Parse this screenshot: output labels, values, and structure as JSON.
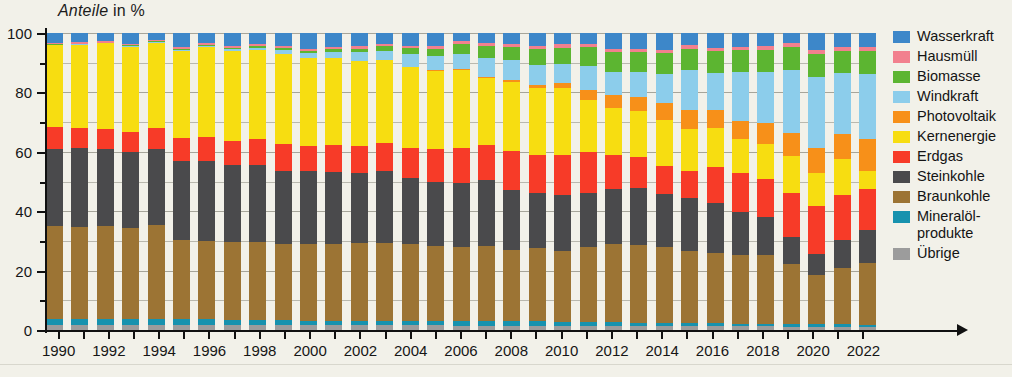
{
  "axis_title": {
    "emphasis": "Anteile",
    "rest": " in %"
  },
  "y_axis": {
    "labels": [
      "0",
      "20",
      "40",
      "60",
      "80",
      "100"
    ],
    "values": [
      0,
      20,
      40,
      60,
      80,
      100
    ],
    "minor_values": [
      10,
      30,
      50,
      70,
      90
    ],
    "min": 0,
    "max": 100
  },
  "x_axis": {
    "tick_labels": [
      "1990",
      "1992",
      "1994",
      "1996",
      "1998",
      "2000",
      "2002",
      "2004",
      "2006",
      "2008",
      "2010",
      "2012",
      "2014",
      "2016",
      "2018",
      "2020",
      "2022"
    ]
  },
  "legend": {
    "items": [
      {
        "label": "Wasserkraft",
        "color": "#3d87c9"
      },
      {
        "label": "Hausmüll",
        "color": "#f2808e"
      },
      {
        "label": "Biomasse",
        "color": "#5cb531"
      },
      {
        "label": "Windkraft",
        "color": "#8ccdeb"
      },
      {
        "label": "Photovoltaik",
        "color": "#f79019"
      },
      {
        "label": "Kernenergie",
        "color": "#f7dd11"
      },
      {
        "label": "Erdgas",
        "color": "#f73b28"
      },
      {
        "label": "Steinkohle",
        "color": "#4a4a4c"
      },
      {
        "label": "Braunkohle",
        "color": "#9c7434"
      },
      {
        "label": "Mineralöl-\nprodukte",
        "color": "#1792ae"
      },
      {
        "label": "Übrige",
        "color": "#9c9c9c"
      }
    ]
  },
  "chart_data": {
    "type": "bar",
    "stacked": true,
    "title": "Anteile in %",
    "xlabel": "",
    "ylabel": "Anteile in %",
    "ylim": [
      0,
      100
    ],
    "grid": true,
    "legend_position": "right",
    "categories": [
      1990,
      1991,
      1992,
      1993,
      1994,
      1995,
      1996,
      1997,
      1998,
      1999,
      2000,
      2001,
      2002,
      2003,
      2004,
      2005,
      2006,
      2007,
      2008,
      2009,
      2010,
      2011,
      2012,
      2013,
      2014,
      2015,
      2016,
      2017,
      2018,
      2019,
      2020,
      2021,
      2022
    ],
    "stack_order_bottom_to_top": [
      "Übrige",
      "Mineralölprodukte",
      "Braunkohle",
      "Steinkohle",
      "Erdgas",
      "Kernenergie",
      "Photovoltaik",
      "Windkraft",
      "Biomasse",
      "Hausmüll",
      "Wasserkraft"
    ],
    "series": [
      {
        "name": "Übrige",
        "color": "#9c9c9c",
        "values": [
          1.6,
          1.6,
          1.6,
          1.6,
          1.6,
          1.6,
          1.6,
          1.6,
          1.6,
          1.6,
          1.6,
          1.6,
          1.6,
          1.6,
          1.6,
          1.6,
          1.5,
          1.5,
          1.5,
          1.5,
          1.4,
          1.4,
          1.4,
          1.4,
          1.3,
          1.3,
          1.3,
          1.2,
          1.2,
          1.1,
          1.1,
          1.1,
          1.0
        ]
      },
      {
        "name": "Mineralölprodukte",
        "color": "#1792ae",
        "values": [
          2.2,
          2.2,
          2.1,
          2.0,
          2.0,
          1.9,
          1.9,
          1.8,
          1.8,
          1.7,
          1.6,
          1.6,
          1.5,
          1.5,
          1.5,
          1.5,
          1.5,
          1.5,
          1.5,
          1.5,
          1.4,
          1.3,
          1.2,
          1.1,
          1.0,
          1.0,
          1.0,
          0.9,
          0.9,
          0.9,
          0.8,
          0.8,
          0.8
        ]
      },
      {
        "name": "Braunkohle",
        "color": "#9c7434",
        "values": [
          31.1,
          30.9,
          31.4,
          31.2,
          31.8,
          26.4,
          26.0,
          26.1,
          25.6,
          25.5,
          25.6,
          25.8,
          26.2,
          26.4,
          26.0,
          25.2,
          25.1,
          25.3,
          24.3,
          25.0,
          23.9,
          25.2,
          26.2,
          26.2,
          25.5,
          24.3,
          23.8,
          23.3,
          23.0,
          20.1,
          16.5,
          19.1,
          20.6
        ]
      },
      {
        "name": "Steinkohle",
        "color": "#4a4a4c",
        "values": [
          26.2,
          26.5,
          25.8,
          25.6,
          25.6,
          26.2,
          26.3,
          25.9,
          25.6,
          24.9,
          24.8,
          24.2,
          23.6,
          24.0,
          22.6,
          21.6,
          21.5,
          22.1,
          20.3,
          18.6,
          18.7,
          18.4,
          18.7,
          19.1,
          18.0,
          17.9,
          16.8,
          14.3,
          12.8,
          9.2,
          7.2,
          9.3,
          11.2
        ]
      },
      {
        "name": "Erdgas",
        "color": "#f73b28",
        "values": [
          7.1,
          6.8,
          6.9,
          6.8,
          6.9,
          7.6,
          7.9,
          8.3,
          8.6,
          8.8,
          8.5,
          9.0,
          9.1,
          9.6,
          10.2,
          11.2,
          11.6,
          12.0,
          13.2,
          12.9,
          13.6,
          13.6,
          11.3,
          10.5,
          9.5,
          9.1,
          12.1,
          13.1,
          12.8,
          14.9,
          16.0,
          15.3,
          13.8
        ]
      },
      {
        "name": "Kernenergie",
        "color": "#f7dd11",
        "values": [
          27.7,
          28.1,
          28.7,
          29.2,
          28.9,
          29.0,
          29.6,
          30.3,
          29.2,
          30.5,
          29.5,
          29.5,
          28.6,
          27.8,
          27.5,
          26.5,
          26.3,
          22.3,
          23.4,
          22.8,
          22.4,
          17.7,
          16.0,
          15.4,
          15.5,
          14.2,
          13.1,
          11.6,
          11.8,
          12.4,
          11.3,
          11.9,
          6.3
        ]
      },
      {
        "name": "Photovoltaik",
        "color": "#f79019",
        "values": [
          0.0,
          0.0,
          0.0,
          0.0,
          0.0,
          0.0,
          0.0,
          0.0,
          0.0,
          0.0,
          0.0,
          0.0,
          0.1,
          0.1,
          0.2,
          0.2,
          0.4,
          0.5,
          0.7,
          1.1,
          1.9,
          3.2,
          4.2,
          4.9,
          5.8,
          6.3,
          5.9,
          6.1,
          7.1,
          7.6,
          8.5,
          8.4,
          10.6
        ]
      },
      {
        "name": "Windkraft",
        "color": "#8ccdeb",
        "values": [
          0.1,
          0.1,
          0.1,
          0.2,
          0.2,
          0.3,
          0.4,
          0.5,
          0.8,
          1.2,
          1.6,
          1.9,
          2.8,
          3.2,
          4.3,
          4.6,
          5.2,
          6.5,
          6.8,
          6.9,
          6.2,
          8.1,
          8.0,
          8.3,
          9.6,
          13.4,
          12.6,
          16.4,
          17.3,
          21.5,
          23.7,
          20.6,
          22.0
        ]
      },
      {
        "name": "Biomasse",
        "color": "#5cb531",
        "values": [
          0.2,
          0.2,
          0.2,
          0.3,
          0.3,
          0.3,
          0.4,
          0.5,
          0.5,
          0.6,
          0.7,
          0.9,
          1.2,
          1.5,
          1.9,
          2.5,
          3.2,
          4.0,
          4.5,
          5.2,
          5.6,
          6.3,
          6.6,
          6.8,
          7.0,
          7.2,
          7.3,
          7.3,
          7.4,
          7.6,
          8.0,
          7.5,
          7.8
        ]
      },
      {
        "name": "Hausmüll",
        "color": "#f2808e",
        "values": [
          0.5,
          0.5,
          0.5,
          0.5,
          0.5,
          0.6,
          0.6,
          0.6,
          0.7,
          0.7,
          0.8,
          0.8,
          0.8,
          0.9,
          0.9,
          1.0,
          1.0,
          1.0,
          1.1,
          1.1,
          1.1,
          1.1,
          1.1,
          1.1,
          1.2,
          1.2,
          1.2,
          1.2,
          1.2,
          1.2,
          1.2,
          1.2,
          1.2
        ]
      },
      {
        "name": "Wasserkraft",
        "color": "#3d87c9",
        "values": [
          3.3,
          3.1,
          2.7,
          3.6,
          2.2,
          4.7,
          3.3,
          4.4,
          3.7,
          4.5,
          5.3,
          4.7,
          4.5,
          3.5,
          4.3,
          4.4,
          2.7,
          3.3,
          3.7,
          4.4,
          3.8,
          3.7,
          5.3,
          5.2,
          5.6,
          4.1,
          4.9,
          4.6,
          4.5,
          3.5,
          5.7,
          4.8,
          4.7
        ]
      }
    ]
  }
}
